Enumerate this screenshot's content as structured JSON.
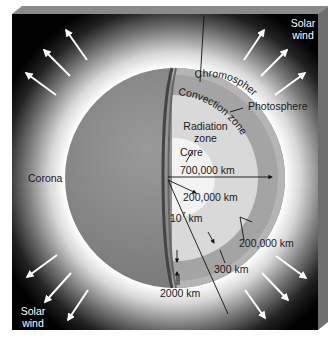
{
  "diagram": {
    "layers": [
      {
        "name": "Core",
        "label": "Core"
      },
      {
        "name": "Radiation zone",
        "label": "Radiation\nzone"
      },
      {
        "name": "Convection zone",
        "label": "Convection zone"
      },
      {
        "name": "Photosphere",
        "label": "Photosphere"
      },
      {
        "name": "Chromosphere",
        "label": "Chromosphere"
      },
      {
        "name": "Corona",
        "label": "Corona"
      }
    ],
    "labels": {
      "chromosphere": "Chromosphere",
      "convection_zone": "Convection zone",
      "photosphere": "Photosphere",
      "radiation_line1": "Radiation",
      "radiation_line2": "zone",
      "core": "Core",
      "corona": "Corona",
      "solar_wind_top_line1": "Solar",
      "solar_wind_top_line2": "wind",
      "solar_wind_bottom_line1": "Solar",
      "solar_wind_bottom_line2": "wind"
    },
    "measurements": {
      "sun_radius": "700,000 km",
      "core_radius": "200,000 km",
      "corona_extent_base": "10",
      "corona_extent_exp": "7",
      "corona_extent_unit": " km",
      "convection_thickness": "200,000 km",
      "photosphere_thickness": "300 km",
      "chromosphere_thickness": "2000 km"
    },
    "colors": {
      "background": "#000000",
      "corona_glow": "#ffffff",
      "surface": "#8c8c8c",
      "convection": "#a9a9a9",
      "radiation": "#dcdcdc",
      "core": "#f2f2f2",
      "box_side": "#6e6e6e",
      "box_top": "#8a8a8a"
    }
  }
}
